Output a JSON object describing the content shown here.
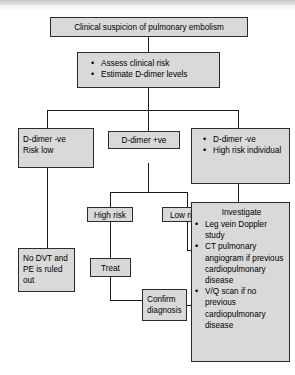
{
  "diagram": {
    "type": "flowchart",
    "fill_color": "#d9d9d9",
    "border_color": "#2b2b2b",
    "nodes": {
      "suspicion": {
        "text": "Clinical suspicion of pulmonary embolism"
      },
      "assess": {
        "items": [
          "Assess clinical risk",
          "Estimate D-dimer levels"
        ]
      },
      "ddimer_neg_low": {
        "line1": "D-dimer -ve",
        "line2": "Risk low"
      },
      "ddimer_pos": {
        "text": "D-dimer +ve"
      },
      "ddimer_neg_high": {
        "items": [
          "D-dimer -ve",
          "High risk individual"
        ]
      },
      "no_dvt": {
        "text": "No DVT and PE is ruled out"
      },
      "high_risk": {
        "text": "High risk"
      },
      "low_risk": {
        "text": "Low risk"
      },
      "treat": {
        "text": "Treat"
      },
      "confirm": {
        "line1": "Confirm",
        "line2": "diagnosis"
      },
      "investigate": {
        "header": "Investigate",
        "items": [
          "Leg vein Doppler study",
          "CT pulmonary angiogram if previous cardiopulmonary disease",
          "V/Q scan if no previous cardiopulmonary disease"
        ]
      }
    }
  }
}
